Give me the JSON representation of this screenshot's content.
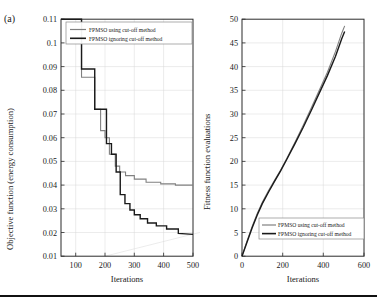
{
  "figure": {
    "panel_label": "(a)",
    "background": "#ffffff",
    "rule_color": "#111111"
  },
  "legend": {
    "cutoff_label": "FPMSO using cut-off method",
    "ignoring_label": "FPMSO ignoring cut-off method",
    "cutoff_color": "#808080",
    "ignoring_color": "#1a1a1a"
  },
  "chart_data": [
    {
      "type": "line",
      "id": "objective-convergence",
      "title": "",
      "xlabel": "Iterations",
      "ylabel": "Objective function (energy consumption)",
      "xlim": [
        50,
        500
      ],
      "ylim": [
        0.01,
        0.11
      ],
      "xticks": [
        100,
        200,
        300,
        400,
        500
      ],
      "xticklabels": [
        "100",
        "200",
        "300",
        "400",
        "500"
      ],
      "yticks": [
        0.01,
        0.02,
        0.03,
        0.04,
        0.05,
        0.06,
        0.07,
        0.08,
        0.09,
        0.1,
        0.11
      ],
      "yticklabels": [
        "0.01",
        "0.02",
        "0.03",
        "0.04",
        "0.05",
        "0.06",
        "0.07",
        "0.08",
        "0.09",
        "0.1",
        "0.11"
      ],
      "grid": true,
      "legend_position": "top-right",
      "drawstyle": "steps-post",
      "series": [
        {
          "name": "FPMSO using cut-off method",
          "color": "#808080",
          "x": [
            50,
            120,
            120,
            140,
            140,
            165,
            165,
            185,
            185,
            200,
            200,
            215,
            215,
            235,
            235,
            250,
            250,
            270,
            270,
            300,
            300,
            340,
            340,
            390,
            390,
            440,
            440,
            500
          ],
          "y": [
            0.11,
            0.11,
            0.0855,
            0.0855,
            0.0855,
            0.0855,
            0.072,
            0.072,
            0.063,
            0.063,
            0.06,
            0.06,
            0.053,
            0.053,
            0.048,
            0.048,
            0.0455,
            0.0455,
            0.044,
            0.044,
            0.0425,
            0.0425,
            0.0412,
            0.0412,
            0.0405,
            0.0405,
            0.04,
            0.04
          ]
        },
        {
          "name": "FPMSO ignoring cut-off method",
          "color": "#1a1a1a",
          "x": [
            50,
            120,
            120,
            140,
            140,
            165,
            165,
            190,
            190,
            205,
            205,
            222,
            222,
            238,
            238,
            252,
            252,
            268,
            268,
            285,
            285,
            300,
            300,
            320,
            320,
            345,
            345,
            375,
            375,
            410,
            410,
            450,
            450,
            500
          ],
          "y": [
            0.11,
            0.11,
            0.089,
            0.089,
            0.089,
            0.089,
            0.072,
            0.072,
            0.072,
            0.072,
            0.0575,
            0.0575,
            0.053,
            0.053,
            0.0455,
            0.0455,
            0.036,
            0.036,
            0.0322,
            0.0322,
            0.0295,
            0.0295,
            0.0275,
            0.0275,
            0.0258,
            0.0258,
            0.024,
            0.024,
            0.0228,
            0.0228,
            0.0215,
            0.0215,
            0.0196,
            0.0192
          ]
        }
      ]
    },
    {
      "type": "line",
      "id": "fitness-evaluations",
      "title": "",
      "xlabel": "Iterations",
      "ylabel": "Fitness function evaluations",
      "xlim": [
        0,
        600
      ],
      "ylim": [
        0,
        50
      ],
      "xticks": [
        0,
        200,
        400,
        600
      ],
      "xticklabels": [
        "0",
        "200",
        "400",
        "600"
      ],
      "yticks": [
        0,
        5,
        10,
        15,
        20,
        25,
        30,
        35,
        40,
        45,
        50
      ],
      "yticklabels": [
        "0",
        "5",
        "10",
        "15",
        "20",
        "25",
        "30",
        "35",
        "40",
        "45",
        "50"
      ],
      "grid": true,
      "legend_position": "bottom-right",
      "drawstyle": "line",
      "series": [
        {
          "name": "FPMSO using cut-off method",
          "color": "#808080",
          "x": [
            0,
            25,
            50,
            75,
            100,
            130,
            160,
            190,
            220,
            260,
            300,
            340,
            380,
            420,
            460,
            490,
            505
          ],
          "y": [
            0,
            3.2,
            6.3,
            9.0,
            11.4,
            13.8,
            16.0,
            18.2,
            20.6,
            24.0,
            27.5,
            31.2,
            35.0,
            38.8,
            43.2,
            47.0,
            48.6
          ]
        },
        {
          "name": "FPMSO ignoring cut-off method",
          "color": "#1a1a1a",
          "x": [
            0,
            25,
            50,
            75,
            100,
            130,
            160,
            190,
            220,
            260,
            300,
            340,
            380,
            420,
            460,
            490,
            505
          ],
          "y": [
            0,
            3.0,
            6.0,
            8.7,
            11.1,
            13.5,
            15.8,
            18.0,
            20.4,
            23.7,
            27.1,
            30.7,
            34.4,
            38.1,
            42.2,
            45.8,
            47.4
          ]
        }
      ]
    }
  ]
}
